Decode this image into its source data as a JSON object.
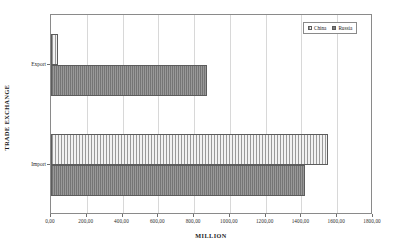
{
  "chart_data": {
    "type": "bar",
    "orientation": "horizontal",
    "title": "",
    "xlabel": "MILLION",
    "ylabel": "TRADE EXCHANGE",
    "categories": [
      "Export",
      "Import"
    ],
    "series": [
      {
        "name": "China",
        "values": [
          40,
          1550
        ]
      },
      {
        "name": "Russia",
        "values": [
          870,
          1420
        ]
      }
    ],
    "xlim": [
      0,
      1800
    ],
    "xticks": [
      0,
      200,
      400,
      600,
      800,
      1000,
      1200,
      1400,
      1600,
      1800
    ],
    "xtick_labels": [
      "0,00",
      "200,00",
      "400,00",
      "600,00",
      "800,00",
      "1000,00",
      "1200,00",
      "1400,00",
      "1600,00",
      "1800,00"
    ],
    "grid": true,
    "legend_position": "top-right",
    "legend_entries": [
      "China",
      "Russia"
    ]
  },
  "legend": {
    "items": [
      {
        "label": "China",
        "swatch": "china-pattern-swatch"
      },
      {
        "label": "Russia",
        "swatch": "russia-pattern-swatch"
      }
    ]
  },
  "axes": {
    "x_title": "MILLION",
    "y_title": "TRADE EXCHANGE"
  }
}
